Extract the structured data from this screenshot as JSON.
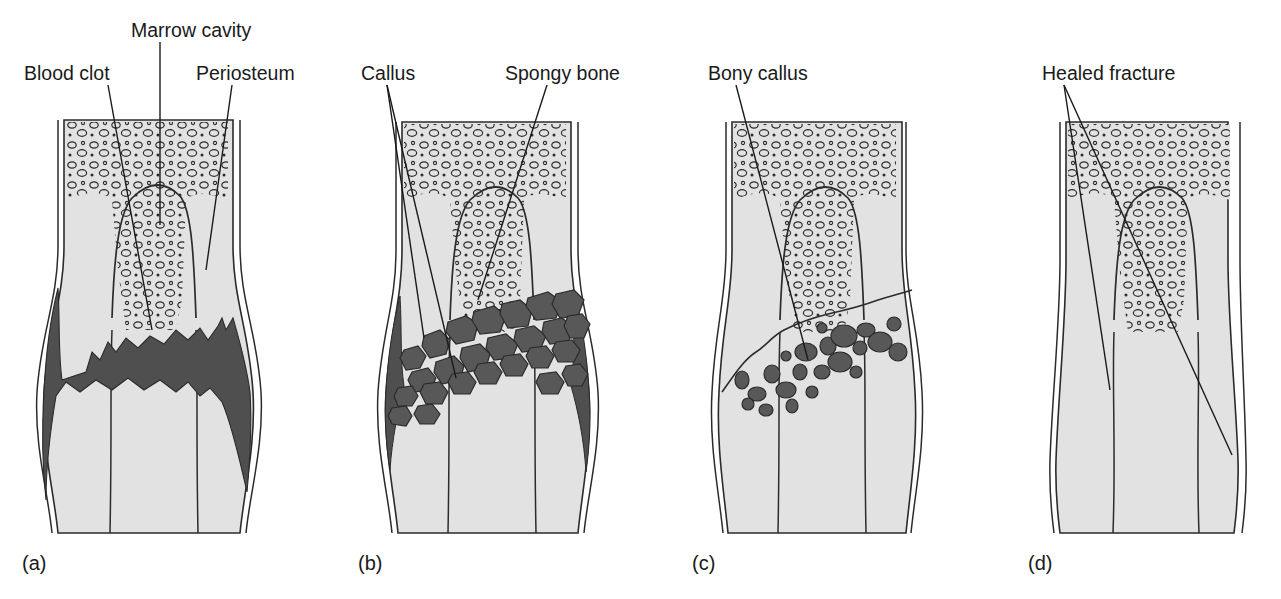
{
  "figure": {
    "background_color": "#ffffff",
    "bone_fill": "#e2e2e2",
    "clot_fill": "#4f4f4f",
    "callus_fill": "#585858",
    "outline_color": "#2b2b2b"
  },
  "labels": {
    "blood_clot": "Blood clot",
    "marrow_cavity": "Marrow  cavity",
    "periosteum": "Periosteum",
    "callus": "Callus",
    "spongy_bone": "Spongy bone",
    "bony_callus": "Bony callus",
    "healed_fracture": "Healed fracture"
  },
  "panels": [
    {
      "key": "a",
      "caption": "(a)",
      "stage": "Blood clot (hematoma) forms at fracture site",
      "labels": [
        "Blood clot",
        "Marrow  cavity",
        "Periosteum"
      ]
    },
    {
      "key": "b",
      "caption": "(b)",
      "stage": "Fibrocartilaginous callus forms",
      "labels": [
        "Callus",
        "Spongy bone"
      ]
    },
    {
      "key": "c",
      "caption": "(c)",
      "stage": "Bony callus of spongy bone forms",
      "labels": [
        "Bony callus"
      ]
    },
    {
      "key": "d",
      "caption": "(d)",
      "stage": "Bone remodeling occurs; fracture healed",
      "labels": [
        "Healed fracture"
      ]
    }
  ]
}
